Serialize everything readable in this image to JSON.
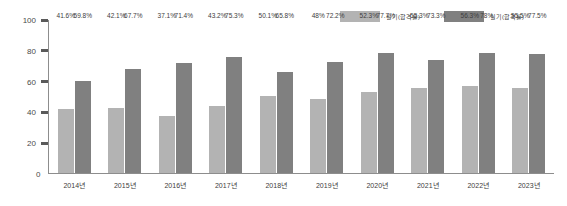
{
  "chart_data": {
    "type": "bar",
    "title": "",
    "xlabel": "",
    "ylabel": "",
    "ylim": [
      0,
      100
    ],
    "yticks": [
      0,
      20,
      40,
      60,
      80,
      100
    ],
    "grid": false,
    "legend_position": "top-right",
    "categories": [
      "2014년",
      "2015년",
      "2016년",
      "2017년",
      "2018년",
      "2019년",
      "2020년",
      "2021년",
      "2022년",
      "2023년"
    ],
    "series": [
      {
        "name": "필기(합격률)",
        "color": "#b3b3b3",
        "values": [
          41.6,
          42.1,
          37.1,
          43.2,
          50.1,
          48.0,
          52.3,
          55.3,
          56.3,
          55.5
        ],
        "labels": [
          "41.6%",
          "42.1%",
          "37.1%",
          "43.2%",
          "50.1%",
          "48%",
          "52.3%",
          "55.3%",
          "56.3%",
          "55.5%"
        ]
      },
      {
        "name": "실기(합격률)",
        "color": "#808080",
        "values": [
          59.8,
          67.7,
          71.4,
          75.3,
          65.8,
          72.2,
          77.7,
          73.3,
          78.0,
          77.5
        ],
        "labels": [
          "59.8%",
          "67.7%",
          "71.4%",
          "75.3%",
          "65.8%",
          "72.2%",
          "77.7%",
          "73.3%",
          "78%",
          "77.5%"
        ]
      }
    ]
  },
  "legend": {
    "items": [
      {
        "label": "필기(합격률)",
        "color": "#b3b3b3"
      },
      {
        "label": "실기(합격률)",
        "color": "#808080"
      }
    ]
  },
  "axis": {
    "y_tick_labels": [
      "100",
      "80",
      "60",
      "40",
      "20",
      "0"
    ],
    "zero_label": "0"
  }
}
